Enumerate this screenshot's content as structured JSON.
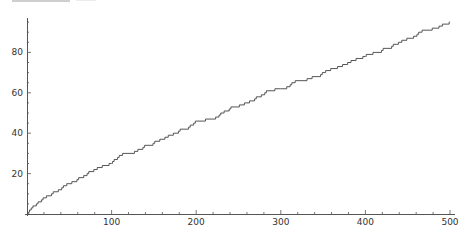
{
  "chart_data": {
    "type": "line",
    "title": "",
    "xlabel": "",
    "ylabel": "",
    "xlim": [
      0,
      500
    ],
    "ylim": [
      0,
      97
    ],
    "grid": false,
    "legend": null,
    "x_ticks": [
      100,
      200,
      300,
      400,
      500
    ],
    "y_ticks": [
      20,
      40,
      60,
      80
    ],
    "x_tick_labels": [
      "100",
      "200",
      "300",
      "400",
      "500"
    ],
    "y_tick_labels": [
      "20",
      "40",
      "60",
      "80"
    ],
    "series": [
      {
        "name": "pi(x)",
        "color": "#555555",
        "x": [
          0,
          2,
          3,
          5,
          7,
          11,
          13,
          17,
          19,
          23,
          29,
          31,
          37,
          41,
          43,
          47,
          53,
          59,
          61,
          67,
          71,
          73,
          79,
          83,
          89,
          97,
          100,
          101,
          103,
          107,
          109,
          113,
          127,
          131,
          137,
          139,
          149,
          151,
          157,
          163,
          167,
          173,
          179,
          181,
          191,
          193,
          197,
          199,
          200,
          211,
          223,
          227,
          229,
          233,
          239,
          241,
          251,
          257,
          263,
          269,
          271,
          277,
          281,
          283,
          293,
          300,
          307,
          311,
          313,
          317,
          331,
          337,
          347,
          349,
          353,
          359,
          367,
          373,
          379,
          383,
          389,
          397,
          400,
          401,
          409,
          419,
          421,
          431,
          433,
          439,
          443,
          449,
          457,
          461,
          463,
          467,
          479,
          487,
          491,
          499,
          500
        ],
        "y": [
          0,
          1,
          2,
          3,
          4,
          5,
          6,
          7,
          8,
          9,
          10,
          11,
          12,
          13,
          14,
          15,
          16,
          17,
          18,
          19,
          20,
          21,
          22,
          23,
          24,
          25,
          25,
          26,
          27,
          28,
          29,
          30,
          31,
          32,
          33,
          34,
          35,
          36,
          37,
          38,
          39,
          40,
          41,
          42,
          43,
          44,
          45,
          46,
          46,
          47,
          48,
          49,
          50,
          51,
          52,
          53,
          54,
          55,
          56,
          57,
          58,
          59,
          60,
          61,
          62,
          62,
          63,
          64,
          65,
          66,
          67,
          68,
          69,
          70,
          71,
          72,
          73,
          74,
          75,
          76,
          77,
          78,
          78,
          79,
          80,
          81,
          82,
          83,
          84,
          85,
          86,
          87,
          88,
          89,
          90,
          91,
          92,
          93,
          94,
          95,
          95
        ]
      }
    ]
  },
  "axes": {
    "origin_px": [
      27,
      214
    ],
    "x_px_per_unit": 0.846,
    "y_px_per_unit": 2.02,
    "axis_color": "#555555",
    "label_color": "#333333"
  }
}
